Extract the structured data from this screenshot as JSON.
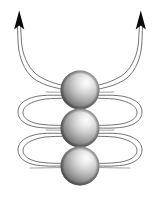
{
  "figure": {
    "canvas": {
      "width": 160,
      "height": 200,
      "background": "#ffffff"
    },
    "caption": "",
    "colors": {
      "background": "#ffffff",
      "field_line": "#5b5b5b",
      "field_line_faint": "#8a8a8a",
      "arrow_head": "#0a0a0a",
      "sphere_highlight": "#fbfbfb",
      "sphere_mid": "#b4b4b4",
      "sphere_shadow": "#4a4a4a",
      "sphere_rim": "#6f6f6f"
    },
    "spheres": [
      {
        "name": "sphere-top",
        "cx": 80,
        "cy": 90,
        "r": 19.5,
        "label": ""
      },
      {
        "name": "sphere-middle",
        "cx": 80,
        "cy": 128,
        "r": 19.5,
        "label": ""
      },
      {
        "name": "sphere-bottom",
        "cx": 80,
        "cy": 166,
        "r": 19.5,
        "label": ""
      }
    ],
    "arrows": [
      {
        "name": "arrow-left",
        "direction": "up",
        "tip_x": 22,
        "tip_y": 12,
        "label": ""
      },
      {
        "name": "arrow-right",
        "direction": "up",
        "tip_x": 138,
        "tip_y": 12,
        "label": ""
      }
    ],
    "loops": [
      {
        "name": "loop-upper",
        "side": "left",
        "cy": 109
      },
      {
        "name": "loop-upper",
        "side": "right",
        "cy": 109
      },
      {
        "name": "loop-lower",
        "side": "left",
        "cy": 147
      },
      {
        "name": "loop-lower",
        "side": "right",
        "cy": 147
      }
    ],
    "annotations": []
  }
}
